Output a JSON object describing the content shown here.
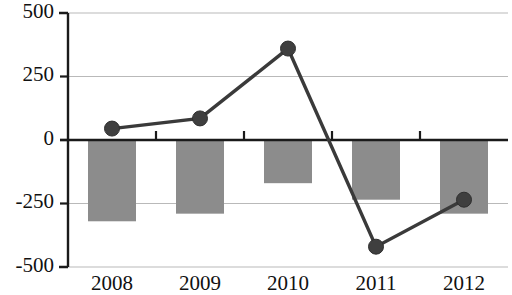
{
  "chart_data": {
    "type": "bar",
    "title": "",
    "subtitle": "",
    "xlabel": "",
    "ylabel": "",
    "categories": [
      "2008",
      "2009",
      "2010",
      "2011",
      "2012"
    ],
    "ylim": [
      -500,
      500
    ],
    "ytick_labels": [
      "500",
      "250",
      "0",
      "-250",
      "-500"
    ],
    "ytick_values": [
      500,
      250,
      0,
      -250,
      -500
    ],
    "grid": true,
    "legend": "none",
    "series": [
      {
        "name": "bars",
        "type": "bar",
        "color": "#8c8c8c",
        "values": [
          -320,
          -290,
          -170,
          -235,
          -290
        ]
      },
      {
        "name": "line",
        "type": "line",
        "color": "#3f3f3f",
        "marker": "circle",
        "values": [
          45,
          85,
          360,
          -420,
          -235
        ]
      }
    ]
  },
  "axes": {
    "y_axis_name": "value-axis",
    "x_axis_name": "year-axis"
  }
}
